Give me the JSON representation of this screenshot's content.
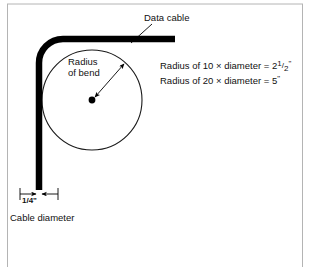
{
  "diagram": {
    "title_labels": {
      "data_cable": "Data cable",
      "radius_line1": "Radius",
      "radius_line2": "of bend",
      "cable_diameter": "Cable diameter",
      "dimension_value": "1/4\""
    },
    "formulas": [
      {
        "prefix": "Radius of 10 × diameter = ",
        "whole": "2",
        "numerator": "1",
        "slash": "/",
        "denominator": "2",
        "unit": "\""
      },
      {
        "prefix": "Radius of 20 × diameter = ",
        "whole": "5",
        "numerator": "",
        "slash": "",
        "denominator": "",
        "unit": "\""
      }
    ],
    "colors": {
      "cable": "#000000",
      "circle_outline": "#1a1a1a",
      "frame": "#b0b0b0",
      "text": "#111111",
      "background": "#ffffff"
    }
  }
}
